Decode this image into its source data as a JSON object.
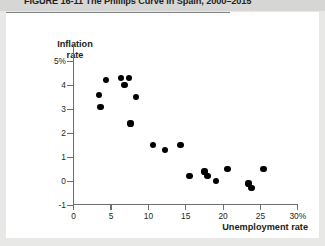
{
  "figure": {
    "title": "FIGURE 16-11   The Phillips Curve in Spain, 2000–2015"
  },
  "chart_data": {
    "type": "scatter",
    "title": "The Phillips Curve in Spain, 2000–2015",
    "xlabel": "Unemployment rate",
    "ylabel": "Inflation rate",
    "xlim": [
      0,
      30
    ],
    "ylim": [
      -1,
      5
    ],
    "xticks": [
      "0",
      "5",
      "10",
      "15",
      "20",
      "25",
      "30%"
    ],
    "yticks": [
      "5%",
      "4",
      "3",
      "2",
      "1",
      "0",
      "-1"
    ],
    "grid": false,
    "legend": "none",
    "zero_reference_line": 0,
    "marker": "filled-circle",
    "marker_color": "#000000",
    "points": [
      {
        "x": 3.4,
        "y": 3.6
      },
      {
        "x": 4.3,
        "y": 4.2
      },
      {
        "x": 3.6,
        "y": 3.1
      },
      {
        "x": 6.3,
        "y": 4.3
      },
      {
        "x": 6.8,
        "y": 4.0
      },
      {
        "x": 7.4,
        "y": 4.3
      },
      {
        "x": 8.3,
        "y": 3.5
      },
      {
        "x": 7.6,
        "y": 2.4
      },
      {
        "x": 10.6,
        "y": 1.5
      },
      {
        "x": 12.2,
        "y": 1.3
      },
      {
        "x": 14.3,
        "y": 1.5
      },
      {
        "x": 15.5,
        "y": 0.2
      },
      {
        "x": 17.5,
        "y": 0.4
      },
      {
        "x": 17.9,
        "y": 0.2
      },
      {
        "x": 19.1,
        "y": 0.0
      },
      {
        "x": 20.6,
        "y": 0.5
      },
      {
        "x": 23.4,
        "y": -0.1
      },
      {
        "x": 23.8,
        "y": -0.3
      },
      {
        "x": 25.4,
        "y": 0.5
      }
    ]
  }
}
